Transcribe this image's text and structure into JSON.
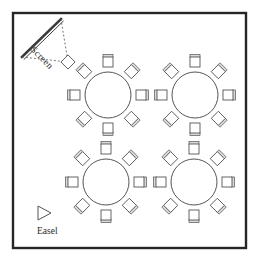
{
  "diagram": {
    "kind": "banquet-room-floor-plan",
    "canvas": {
      "width": 258,
      "height": 262
    },
    "colors": {
      "page_background": "#ffffff",
      "room_border": "#262626",
      "room_fill": "#ffffff",
      "furniture_stroke": "#555555",
      "furniture_fill": "#ffffff",
      "chair_rail_fill": "#d9d9d9",
      "screen_stroke": "#3a3a3a",
      "projection_dash": "#6a6a6a",
      "label_text": "#2b2b2b"
    },
    "room": {
      "name": "room-outline",
      "x": 13,
      "y": 13,
      "width": 233,
      "height": 235,
      "border_width": 2.4
    },
    "screen": {
      "label": "Screen",
      "label_rotation_deg": 45,
      "line_start": {
        "x": 22,
        "y": 57
      },
      "line_end": {
        "x": 61,
        "y": 19
      },
      "line_width": 2.6,
      "projection_apex": {
        "x": 68,
        "y": 62
      },
      "dash_pattern": "2 2"
    },
    "easel": {
      "label": "Easel",
      "triangle": {
        "x": 38,
        "y": 206,
        "width": 13,
        "height": 14
      },
      "label_position": {
        "x": 37,
        "y": 234
      }
    },
    "tables": [
      {
        "name": "table-top-left",
        "center": {
          "x": 108,
          "y": 95
        },
        "radius": 23,
        "seats": 8,
        "chair_distance": 33
      },
      {
        "name": "table-top-right",
        "center": {
          "x": 195,
          "y": 95
        },
        "radius": 23,
        "seats": 8,
        "chair_distance": 33
      },
      {
        "name": "table-bottom-left",
        "center": {
          "x": 106,
          "y": 182
        },
        "radius": 23,
        "seats": 8,
        "chair_distance": 33
      },
      {
        "name": "table-bottom-right",
        "center": {
          "x": 194,
          "y": 182
        },
        "radius": 23,
        "seats": 8,
        "chair_distance": 33
      }
    ],
    "chair": {
      "seat_size": 10,
      "rail_thickness": 3,
      "angles_deg": [
        270,
        315,
        0,
        45,
        90,
        135,
        180,
        225
      ]
    },
    "summary": {
      "table_count": 4,
      "seats_per_table": 8,
      "total_seats": 32
    }
  }
}
